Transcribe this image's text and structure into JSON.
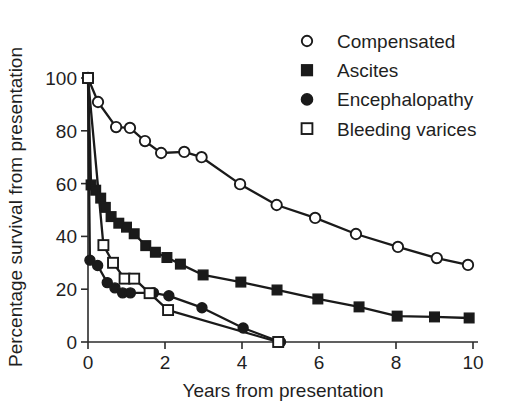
{
  "chart_data": {
    "type": "line",
    "title": "",
    "xlabel": "Years from presentation",
    "ylabel": "Percentage survival from presentation",
    "xlim": [
      0,
      10
    ],
    "ylim": [
      0,
      100
    ],
    "xticks": [
      "0",
      "2",
      "4",
      "6",
      "8",
      "10"
    ],
    "xtick_values": [
      0,
      2,
      4,
      6,
      8,
      10
    ],
    "yticks": [
      "0",
      "20",
      "40",
      "60",
      "80",
      "100"
    ],
    "ytick_values": [
      0,
      20,
      40,
      60,
      80,
      100
    ],
    "grid": false,
    "legend_position": "top-right",
    "series": [
      {
        "name": "Compensated",
        "marker": "open-circle",
        "x": [
          0,
          0.26,
          0.73,
          1.09,
          1.48,
          1.9,
          2.5,
          2.95,
          3.95,
          4.9,
          5.9,
          6.96,
          8.05,
          9.06,
          9.87
        ],
        "y": [
          100,
          90.9,
          81.4,
          81.1,
          76.1,
          71.6,
          72,
          70,
          59.8,
          51.9,
          47,
          40.9,
          36,
          31.8,
          29.2
        ]
      },
      {
        "name": "Ascites",
        "marker": "filled-square",
        "x": [
          0,
          0.08,
          0.2,
          0.33,
          0.45,
          0.6,
          0.8,
          1.0,
          1.2,
          1.5,
          1.75,
          2.05,
          2.4,
          2.99,
          3.97,
          4.91,
          5.97,
          7.04,
          8.03,
          9.0,
          9.9
        ],
        "y": [
          100,
          59.5,
          57.5,
          54.5,
          51,
          47.5,
          45,
          43.5,
          41,
          36.5,
          34,
          32,
          29.5,
          25.4,
          22.7,
          19.7,
          16.3,
          13.3,
          9.8,
          9.5,
          9.1
        ]
      },
      {
        "name": "Encephalopathy",
        "marker": "filled-circle",
        "x": [
          0,
          0.05,
          0.25,
          0.5,
          0.7,
          0.9,
          1.1,
          1.7,
          2.1,
          2.96,
          4.03,
          5.0
        ],
        "y": [
          100,
          31,
          29,
          22.5,
          20.5,
          18.6,
          18.6,
          18.6,
          17.5,
          13,
          5.3,
          0
        ]
      },
      {
        "name": "Bleeding varices",
        "marker": "open-square",
        "x": [
          0,
          0.4,
          0.65,
          0.95,
          1.2,
          1.6,
          2.08,
          4.94
        ],
        "y": [
          100,
          36.7,
          30,
          24,
          24,
          18.5,
          12.1,
          0
        ]
      }
    ]
  },
  "legend": {
    "items": [
      {
        "label": "Compensated",
        "marker": "open-circle"
      },
      {
        "label": "Ascites",
        "marker": "filled-square"
      },
      {
        "label": "Encephalopathy",
        "marker": "filled-circle"
      },
      {
        "label": "Bleeding varices",
        "marker": "open-square"
      }
    ]
  },
  "colors": {
    "ink": "#1a1a1a",
    "background": "#ffffff"
  }
}
